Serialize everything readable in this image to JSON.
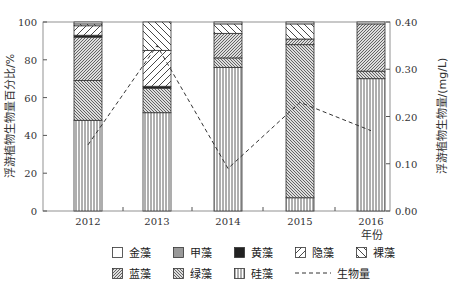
{
  "chart_data": {
    "type": "stacked-bar+line",
    "categories": [
      "2012",
      "2013",
      "2014",
      "2015",
      "2016"
    ],
    "xlabel": "年份",
    "ylabel_left": "浮游植物生物量百分比/%",
    "ylabel_right": "浮游植物生物量/(mg/L)",
    "ylim_left": [
      0,
      100
    ],
    "ylim_right": [
      0,
      0.4
    ],
    "yticks_left": [
      "0",
      "20",
      "40",
      "60",
      "80",
      "100"
    ],
    "yticks_right": [
      "0.00",
      "0.10",
      "0.20",
      "0.30",
      "0.40"
    ],
    "series": [
      {
        "name": "硅藻",
        "pattern": "vertical",
        "values": [
          48,
          52,
          76,
          7,
          70
        ]
      },
      {
        "name": "绿藻",
        "pattern": "dense-back",
        "values": [
          21,
          13,
          5,
          81,
          4
        ]
      },
      {
        "name": "蓝藻",
        "pattern": "dense-diag",
        "values": [
          23,
          0,
          13,
          3,
          25
        ]
      },
      {
        "name": "黄藻",
        "pattern": "black",
        "values": [
          1,
          1,
          0,
          0,
          0
        ]
      },
      {
        "name": "甲藻",
        "pattern": "gray",
        "values": [
          0,
          0,
          0,
          0,
          0
        ]
      },
      {
        "name": "隐藻",
        "pattern": "diag",
        "values": [
          5,
          19,
          0,
          0,
          0
        ]
      },
      {
        "name": "裸藻",
        "pattern": "back",
        "values": [
          1,
          15,
          5,
          8,
          0
        ]
      },
      {
        "name": "金藻",
        "pattern": "white",
        "values": [
          1,
          0,
          1,
          1,
          1
        ]
      }
    ],
    "line": {
      "name": "生物量",
      "values": [
        0.14,
        0.35,
        0.09,
        0.23,
        0.17
      ]
    }
  },
  "legend": {
    "row1": [
      "金藻",
      "甲藻",
      "黄藻",
      "隐藻",
      "裸藻"
    ],
    "row2": [
      "蓝藻",
      "绿藻",
      "硅藻",
      "生物量"
    ]
  }
}
